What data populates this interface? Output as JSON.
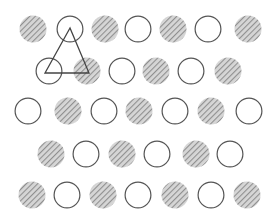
{
  "figure": {
    "width": 275,
    "height": 218,
    "circle_radius": 13.5,
    "colors": {
      "open_stroke": "#555555",
      "hatch_fill": "#d6d6d6",
      "hatch_stripe": "#8f8f8f",
      "triangle_stroke": "#444444",
      "background": "#ffffff"
    },
    "rows": [
      {
        "y": 29,
        "circles": [
          {
            "x": 33,
            "type": "hatched"
          },
          {
            "x": 70,
            "type": "open"
          },
          {
            "x": 105,
            "type": "hatched"
          },
          {
            "x": 138,
            "type": "open"
          },
          {
            "x": 173,
            "type": "hatched"
          },
          {
            "x": 208,
            "type": "open"
          },
          {
            "x": 248,
            "type": "hatched"
          }
        ]
      },
      {
        "y": 71,
        "circles": [
          {
            "x": 49,
            "type": "open"
          },
          {
            "x": 87,
            "type": "hatched"
          },
          {
            "x": 122,
            "type": "open"
          },
          {
            "x": 156,
            "type": "hatched"
          },
          {
            "x": 191,
            "type": "open"
          },
          {
            "x": 228,
            "type": "hatched"
          }
        ]
      },
      {
        "y": 111,
        "circles": [
          {
            "x": 28,
            "type": "open"
          },
          {
            "x": 68,
            "type": "hatched"
          },
          {
            "x": 104,
            "type": "open"
          },
          {
            "x": 139,
            "type": "hatched"
          },
          {
            "x": 175,
            "type": "open"
          },
          {
            "x": 211,
            "type": "hatched"
          },
          {
            "x": 249,
            "type": "open"
          }
        ]
      },
      {
        "y": 154,
        "circles": [
          {
            "x": 51,
            "type": "hatched"
          },
          {
            "x": 86,
            "type": "open"
          },
          {
            "x": 122,
            "type": "hatched"
          },
          {
            "x": 157,
            "type": "open"
          },
          {
            "x": 196,
            "type": "hatched"
          },
          {
            "x": 230,
            "type": "open"
          }
        ]
      },
      {
        "y": 195,
        "circles": [
          {
            "x": 32,
            "type": "hatched"
          },
          {
            "x": 67,
            "type": "open"
          },
          {
            "x": 103,
            "type": "hatched"
          },
          {
            "x": 138,
            "type": "open"
          },
          {
            "x": 175,
            "type": "hatched"
          },
          {
            "x": 211,
            "type": "open"
          },
          {
            "x": 247,
            "type": "hatched"
          }
        ]
      }
    ],
    "triangle": {
      "points": [
        [
          70,
          28
        ],
        [
          45,
          73
        ],
        [
          89,
          73
        ]
      ]
    }
  }
}
